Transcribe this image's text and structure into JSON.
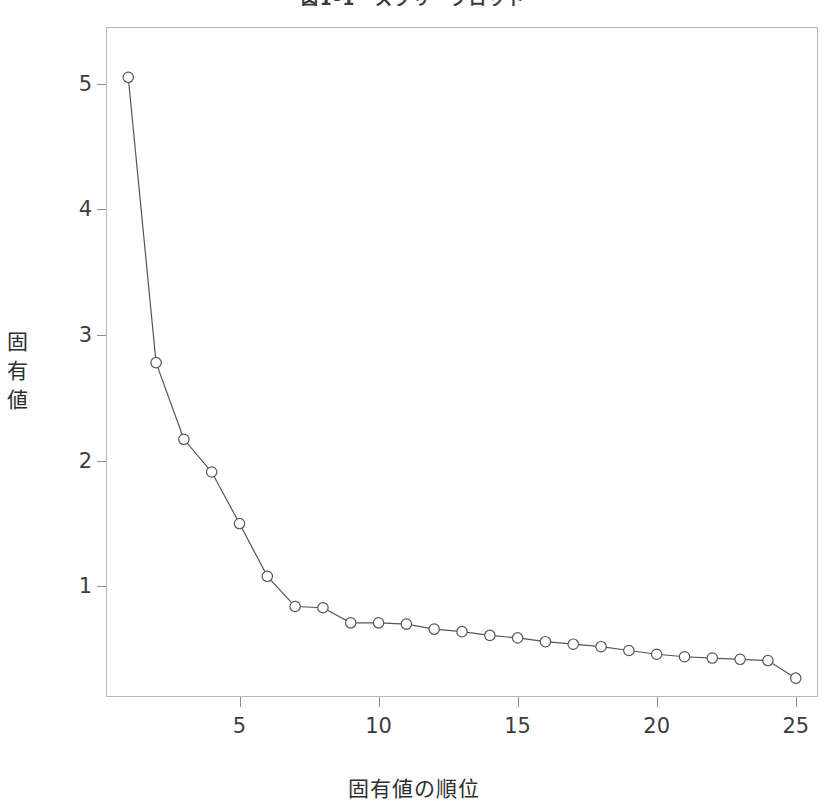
{
  "figure": {
    "title": "図1-1　スクリープロット",
    "title_cropped": true,
    "background": "#ffffff",
    "frame_color": "#b9b9b9",
    "line_color": "#555555",
    "marker_color": "#555555"
  },
  "axes": {
    "y_title": "固有値",
    "y_title_chars": [
      "固",
      "有",
      "値"
    ],
    "x_title": "固有値の順位",
    "y_ticks": [
      1,
      2,
      3,
      4,
      5
    ],
    "y_tick_labels": [
      "1",
      "2",
      "3",
      "4",
      "5"
    ],
    "x_ticks": [
      5,
      10,
      15,
      20,
      25
    ],
    "x_tick_labels": [
      "5",
      "10",
      "15",
      "20",
      "25"
    ]
  },
  "chart_data": {
    "type": "line",
    "title": "図1-1　スクリープロット",
    "xlabel": "固有値の順位",
    "ylabel": "固有値",
    "grid": false,
    "legend": "none",
    "marker": "open-circle",
    "x": [
      1,
      2,
      3,
      4,
      5,
      6,
      7,
      8,
      9,
      10,
      11,
      12,
      13,
      14,
      15,
      16,
      17,
      18,
      19,
      20,
      21,
      22,
      23,
      24,
      25
    ],
    "values": [
      5.05,
      2.78,
      2.17,
      1.91,
      1.5,
      1.08,
      0.84,
      0.83,
      0.71,
      0.71,
      0.7,
      0.66,
      0.64,
      0.61,
      0.59,
      0.56,
      0.54,
      0.52,
      0.49,
      0.46,
      0.44,
      0.43,
      0.42,
      0.41,
      0.27
    ],
    "xlim": [
      0.2,
      25.8
    ],
    "ylim": [
      0.12,
      5.45
    ],
    "categories": [
      "1",
      "2",
      "3",
      "4",
      "5",
      "6",
      "7",
      "8",
      "9",
      "10",
      "11",
      "12",
      "13",
      "14",
      "15",
      "16",
      "17",
      "18",
      "19",
      "20",
      "21",
      "22",
      "23",
      "24",
      "25"
    ]
  }
}
